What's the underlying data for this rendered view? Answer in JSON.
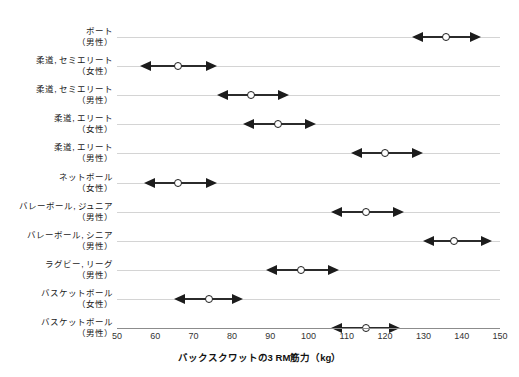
{
  "chart_data": {
    "type": "scatter",
    "title": "",
    "xlabel": "バックスクワットの3 RM筋力（kg）",
    "ylabel": "",
    "xlim": [
      50,
      150
    ],
    "xticks": [
      50,
      60,
      70,
      80,
      90,
      100,
      110,
      120,
      130,
      140,
      150
    ],
    "grid": false,
    "legend": "none",
    "marker_style": "open-circle",
    "error_style": "double-headed-arrow",
    "unit": "kg",
    "categories": [
      "ボート（男性）",
      "柔道, セミエリート（女性）",
      "柔道, セミエリート（男性）",
      "柔道, エリート（女性）",
      "柔道, エリート（男性）",
      "ネットボール（女性）",
      "バレーボール, ジュニア（男性）",
      "バレーボール, シニア（男性）",
      "ラグビー, リーグ（男性）",
      "バスケットボール（女性）",
      "バスケットボール（男性）"
    ],
    "points": [
      {
        "sport": "ボート",
        "group": "（男性）",
        "mean": 136,
        "low": 127,
        "high": 145
      },
      {
        "sport": "柔道, セミエリート",
        "group": "（女性）",
        "mean": 66,
        "low": 56,
        "high": 76
      },
      {
        "sport": "柔道, セミエリート",
        "group": "（男性）",
        "mean": 85,
        "low": 76,
        "high": 95
      },
      {
        "sport": "柔道, エリート",
        "group": "（女性）",
        "mean": 92,
        "low": 83,
        "high": 102
      },
      {
        "sport": "柔道, エリート",
        "group": "（男性）",
        "mean": 120,
        "low": 111,
        "high": 130
      },
      {
        "sport": "ネットボール",
        "group": "（女性）",
        "mean": 66,
        "low": 57,
        "high": 76
      },
      {
        "sport": "バレーボール, ジュニア",
        "group": "（男性）",
        "mean": 115,
        "low": 106,
        "high": 125
      },
      {
        "sport": "バレーボール, シニア",
        "group": "（男性）",
        "mean": 138,
        "low": 130,
        "high": 148
      },
      {
        "sport": "ラグビー, リーグ",
        "group": "（男性）",
        "mean": 98,
        "low": 89,
        "high": 108
      },
      {
        "sport": "バスケットボール",
        "group": "（女性）",
        "mean": 74,
        "low": 65,
        "high": 83
      },
      {
        "sport": "バスケットボール",
        "group": "（男性）",
        "mean": 115,
        "low": 106,
        "high": 124
      }
    ]
  },
  "axis": {
    "x_title": "バックスクワットの3 RM筋力（kg）",
    "tick_labels": [
      "50",
      "60",
      "70",
      "80",
      "90",
      "100",
      "110",
      "120",
      "130",
      "140",
      "150"
    ]
  },
  "colors": {
    "marker_stroke": "#1c1c1c",
    "whisker": "#2b2b2b",
    "baseline": "#d4d4d4",
    "axis": "#8c8c8c",
    "text": "#1a1a1a",
    "background": "#ffffff"
  }
}
